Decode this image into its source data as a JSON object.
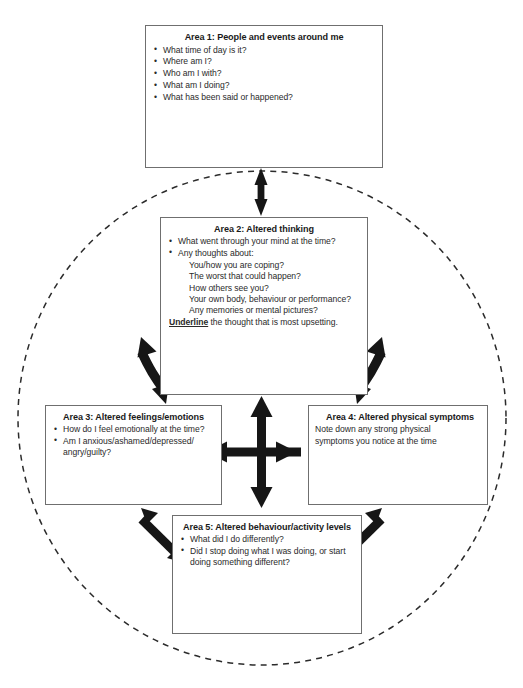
{
  "diagram": {
    "type": "five-areas-assessment",
    "line_color": "#1a1a1a",
    "box_border_color": "#6f6f6f",
    "circle_style": "dashed"
  },
  "areas": [
    {
      "id": "area1",
      "title": "Area 1: People and events around me",
      "bullets": [
        "What time of day is it?",
        "Where am I?",
        "Who am I with?",
        "What am I doing?",
        "What has been said or happened?"
      ]
    },
    {
      "id": "area2",
      "title": "Area 2: Altered thinking",
      "bullets": [
        "What went through your mind at the time?",
        "Any thoughts about:"
      ],
      "sub_items": [
        "You/how you are coping?",
        "The worst that could happen?",
        "How others see you?",
        "Your own body, behaviour or performance?",
        "Any memories or mental pictures?"
      ],
      "footer_emphasis": "Underline",
      "footer_rest": " the thought that is most upsetting."
    },
    {
      "id": "area3",
      "title": "Area 3: Altered feelings/emotions",
      "bullets": [
        "How do I feel emotionally at the time?",
        "Am I anxious/ashamed/depressed/ angry/guilty?"
      ]
    },
    {
      "id": "area4",
      "title": "Area 4: Altered physical symptoms",
      "lines": [
        "Note down any strong physical",
        "symptoms you notice at the time"
      ]
    },
    {
      "id": "area5",
      "title": "Area 5: Altered behaviour/activity levels",
      "bullets": [
        "What did I do differently?",
        "Did I stop doing what I was doing, or start doing something different?"
      ]
    }
  ],
  "connectors": [
    {
      "name": "arrow-area1-area2",
      "kind": "double-headed-vertical"
    },
    {
      "name": "arrow-area2-area3",
      "kind": "double-headed-curved-diagonal"
    },
    {
      "name": "arrow-area2-area4",
      "kind": "double-headed-curved-diagonal"
    },
    {
      "name": "arrow-area3-area5",
      "kind": "double-headed-diagonal"
    },
    {
      "name": "arrow-area4-area5",
      "kind": "double-headed-diagonal"
    },
    {
      "name": "arrow-central-cross",
      "kind": "four-way-cross"
    }
  ]
}
